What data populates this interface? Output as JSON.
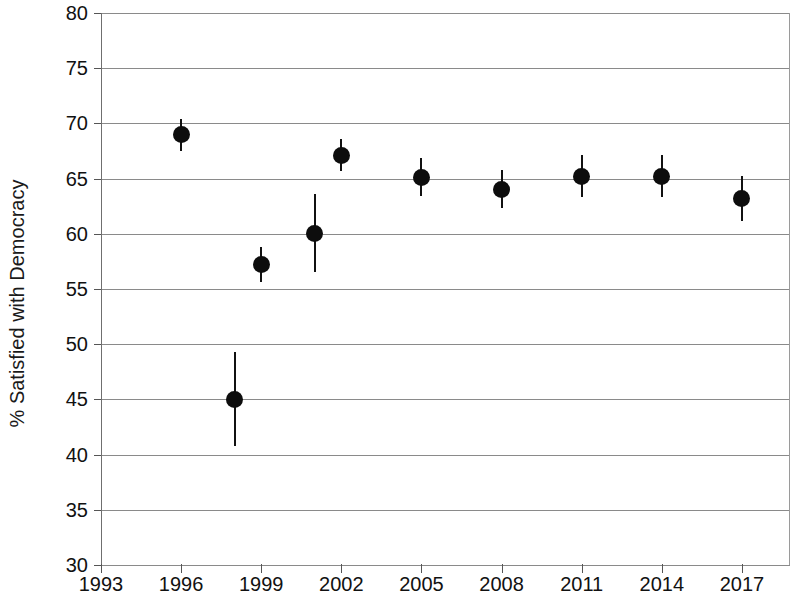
{
  "chart_data": {
    "type": "scatter",
    "title": "",
    "subtitle": "",
    "xlabel": "",
    "ylabel": "% Satisfied with Democracy",
    "xlim": [
      1993,
      2018.8
    ],
    "ylim": [
      30,
      80
    ],
    "x_ticks": [
      1993,
      1996,
      1999,
      2002,
      2005,
      2008,
      2011,
      2014,
      2017
    ],
    "x_tick_labels": [
      "1993",
      "1996",
      "1999",
      "2002",
      "2005",
      "2008",
      "2011",
      "2014",
      "2017"
    ],
    "y_ticks": [
      30,
      35,
      40,
      45,
      50,
      55,
      60,
      65,
      70,
      75,
      80
    ],
    "y_tick_labels": [
      "30",
      "35",
      "40",
      "45",
      "50",
      "55",
      "60",
      "65",
      "70",
      "75",
      "80"
    ],
    "grid": "horizontal",
    "legend": "none",
    "marker": "filled-circle",
    "marker_color": "#0d0d0d",
    "errorbar_color": "#111111",
    "gridline_color": "#8a8a8a",
    "series": [
      {
        "name": "% Satisfied with Democracy",
        "points": [
          {
            "x": 1996,
            "y": 69.0,
            "y_low": 67.5,
            "y_high": 70.4
          },
          {
            "x": 1998,
            "y": 45.0,
            "y_low": 40.8,
            "y_high": 49.3
          },
          {
            "x": 1999,
            "y": 57.2,
            "y_low": 55.6,
            "y_high": 58.8
          },
          {
            "x": 2001,
            "y": 60.0,
            "y_low": 56.5,
            "y_high": 63.6
          },
          {
            "x": 2002,
            "y": 67.1,
            "y_low": 65.7,
            "y_high": 68.6
          },
          {
            "x": 2005,
            "y": 65.1,
            "y_low": 63.4,
            "y_high": 66.9
          },
          {
            "x": 2008,
            "y": 64.0,
            "y_low": 62.3,
            "y_high": 65.8
          },
          {
            "x": 2011,
            "y": 65.2,
            "y_low": 63.3,
            "y_high": 67.1
          },
          {
            "x": 2014,
            "y": 65.2,
            "y_low": 63.3,
            "y_high": 67.1
          },
          {
            "x": 2017,
            "y": 63.2,
            "y_low": 61.2,
            "y_high": 65.2
          }
        ]
      }
    ]
  }
}
